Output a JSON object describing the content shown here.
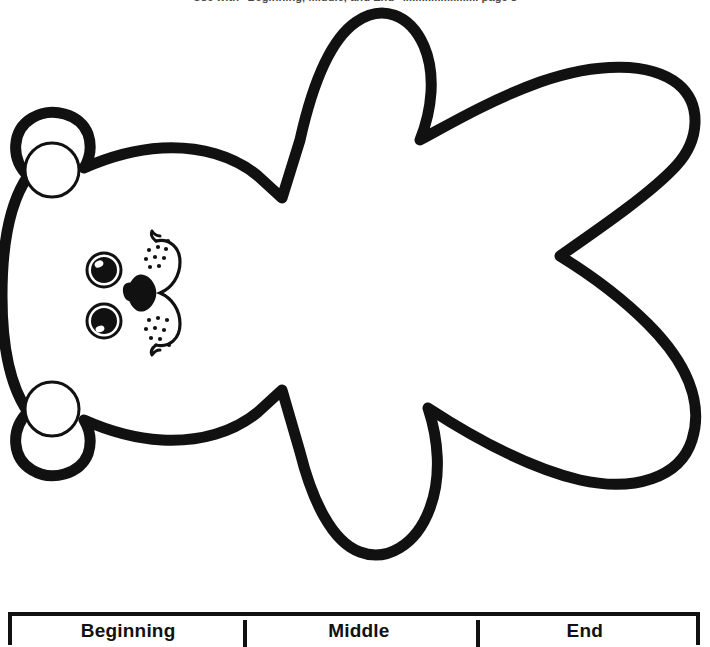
{
  "page": {
    "header_text": "Use with \"Beginning, Middle, and End\" ........................ page 8",
    "page_number": "",
    "background_color": "#ffffff",
    "ink_color": "#111111"
  },
  "artwork": {
    "name": "bear-cutout-template",
    "description": "Outline drawing of a teddy bear template, rotated 90 degrees counter-clockwise (head at left)",
    "stroke_color": "#111111",
    "fill_color": "#ffffff",
    "features": {
      "ear_top": "ear-top",
      "ear_bottom": "ear-bottom",
      "eye_top": "eye-top",
      "eye_bottom": "eye-bottom",
      "nose": "nose",
      "mouth": "mouth",
      "muzzle": "muzzle",
      "arm_upper": "arm-upper",
      "arm_lower": "arm-lower",
      "leg_upper": "leg-upper",
      "leg_lower": "leg-lower",
      "body": "body"
    }
  },
  "sequence_table": {
    "name": "beginning-middle-end-table",
    "border_color": "#111111",
    "columns": [
      {
        "id": "beginning",
        "label": "Beginning"
      },
      {
        "id": "middle",
        "label": "Middle"
      },
      {
        "id": "end",
        "label": "End"
      }
    ]
  }
}
